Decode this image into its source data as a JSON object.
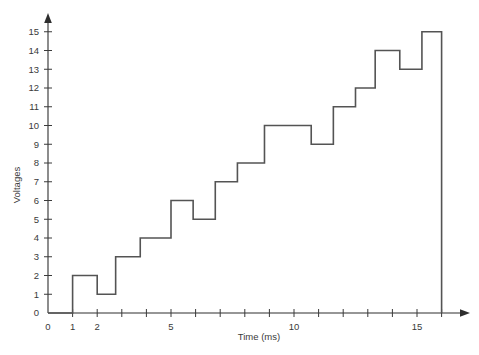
{
  "chart_data": {
    "type": "line",
    "title": "",
    "xlabel": "Time (ms)",
    "ylabel": "Voltages",
    "xlim": [
      0,
      16.6
    ],
    "ylim": [
      0,
      15.8
    ],
    "grid": false,
    "legend": "none",
    "style": "step-post",
    "x_ticks": [
      0,
      1,
      2,
      3,
      4,
      5,
      6,
      7,
      8,
      9,
      10,
      11,
      12,
      13,
      14,
      15,
      16
    ],
    "x_tick_labels": [
      "0",
      "1",
      "2",
      "",
      "",
      "5",
      "",
      "",
      "",
      "",
      "10",
      "",
      "",
      "",
      "",
      "15",
      ""
    ],
    "y_ticks": [
      0,
      1,
      2,
      3,
      4,
      5,
      6,
      7,
      8,
      9,
      10,
      11,
      12,
      13,
      14,
      15
    ],
    "y_tick_labels": [
      "0",
      "1",
      "2",
      "3",
      "4",
      "5",
      "6",
      "7",
      "8",
      "9",
      "10",
      "11",
      "12",
      "13",
      "14",
      "15"
    ],
    "steps": [
      {
        "x_start": 0.0,
        "x_end": 1.0,
        "value": 0
      },
      {
        "x_start": 1.0,
        "x_end": 2.0,
        "value": 2
      },
      {
        "x_start": 2.0,
        "x_end": 2.75,
        "value": 1
      },
      {
        "x_start": 2.75,
        "x_end": 3.75,
        "value": 3
      },
      {
        "x_start": 3.75,
        "x_end": 5.0,
        "value": 4
      },
      {
        "x_start": 5.0,
        "x_end": 5.9,
        "value": 6
      },
      {
        "x_start": 5.9,
        "x_end": 6.8,
        "value": 5
      },
      {
        "x_start": 6.8,
        "x_end": 7.7,
        "value": 7
      },
      {
        "x_start": 7.7,
        "x_end": 8.8,
        "value": 8
      },
      {
        "x_start": 8.8,
        "x_end": 10.7,
        "value": 10
      },
      {
        "x_start": 10.7,
        "x_end": 11.6,
        "value": 9
      },
      {
        "x_start": 11.6,
        "x_end": 12.5,
        "value": 11
      },
      {
        "x_start": 12.5,
        "x_end": 13.3,
        "value": 12
      },
      {
        "x_start": 13.3,
        "x_end": 14.3,
        "value": 14
      },
      {
        "x_start": 14.3,
        "x_end": 15.2,
        "value": 13
      },
      {
        "x_start": 15.2,
        "x_end": 16.0,
        "value": 15
      }
    ],
    "colors": {
      "line": "#545454",
      "axis": "#2e2e2e",
      "text": "#3a3a3a",
      "background": "#ffffff"
    }
  }
}
